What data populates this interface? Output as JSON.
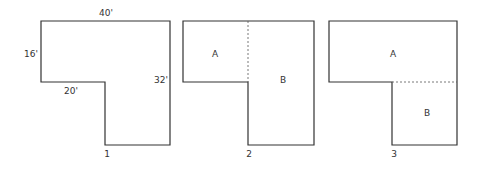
{
  "figures": [
    {
      "id": "1",
      "caption": "1",
      "dimensions": {
        "top": "40'",
        "left": "16'",
        "inner_bottom": "20'",
        "right": "32'"
      }
    },
    {
      "id": "2",
      "caption": "2",
      "regions": [
        "A",
        "B"
      ],
      "split": "vertical dashed line"
    },
    {
      "id": "3",
      "caption": "3",
      "regions": [
        "A",
        "B"
      ],
      "split": "horizontal dashed line"
    }
  ],
  "colors": {
    "stroke": "#333333",
    "background": "#ffffff"
  }
}
